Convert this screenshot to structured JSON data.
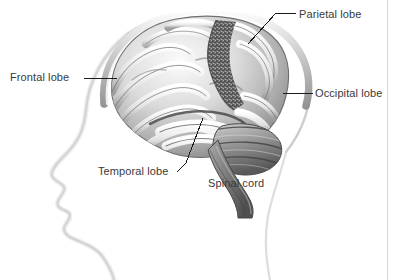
{
  "figure": {
    "view": "left lateral profile",
    "palette": {
      "background": "#ffffff",
      "label_text": "#3a3a3a",
      "leader_line": "#1a1a1a",
      "head_outline": "#b9b9b9",
      "skull_vault": "#9a9a9a",
      "brain_light": "#f2f2f2",
      "brain_mid": "#b0b0b0",
      "brain_dark": "#4e4e4e",
      "stipple_band": "#4a4a4a",
      "panel_rule": "#d8d8d8"
    }
  },
  "labels": [
    {
      "id": "frontal",
      "text": "Frontal lobe",
      "leader": "horizontal",
      "points_to": "anterior cerebrum"
    },
    {
      "id": "parietal",
      "text": "Parietal lobe",
      "leader": "diagonal-then-horizontal",
      "points_to": "superior posterior cerebrum"
    },
    {
      "id": "occipital",
      "text": "Occipital lobe",
      "leader": "horizontal",
      "points_to": "posterior cerebrum"
    },
    {
      "id": "temporal",
      "text": "Temporal lobe",
      "leader": "diagonal-hook",
      "points_to": "inferior lateral cerebrum"
    },
    {
      "id": "spinal",
      "text": "Spinal cord",
      "leader": "none",
      "points_to": "brainstem continuation"
    }
  ]
}
